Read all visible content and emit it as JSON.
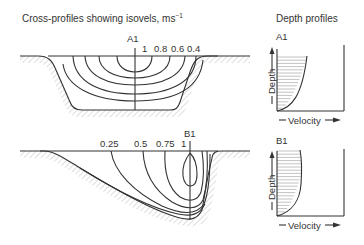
{
  "title_left": "Cross-profiles showing isovels, ms",
  "title_left_sup": "−1",
  "title_right": "Depth profiles",
  "section_a": {
    "label": "A1",
    "isovel_labels": [
      "1",
      "0.8",
      "0.6",
      "0.4"
    ]
  },
  "section_b": {
    "label": "B1",
    "isovel_labels": [
      "0.25",
      "0.5",
      "0.75",
      "1"
    ]
  },
  "profile_a": {
    "label": "A1",
    "y_axis": "Depth",
    "x_axis": "Velocity"
  },
  "profile_b": {
    "label": "B1",
    "y_axis": "Depth",
    "x_axis": "Velocity"
  },
  "colors": {
    "line": "#333333",
    "hatch": "#bbbbbb",
    "grid": "#999999"
  }
}
